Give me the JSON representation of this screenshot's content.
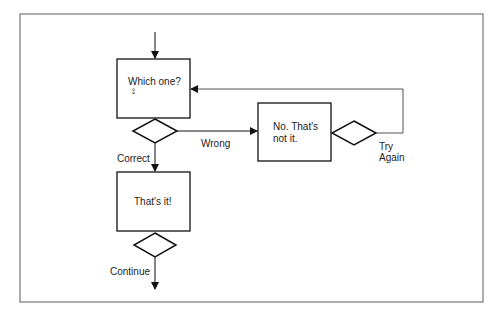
{
  "diagram": {
    "type": "flowchart",
    "nodes": {
      "question": {
        "label": "Which one?",
        "sub": "°°"
      },
      "wrong_box": {
        "line1": "No. That's",
        "line2": "not it."
      },
      "correct_box": {
        "label": "That's it!"
      }
    },
    "edges": {
      "wrong": "Wrong",
      "correct": "Correct",
      "try_again_1": "Try",
      "try_again_2": "Again",
      "continue": "Continue"
    }
  }
}
